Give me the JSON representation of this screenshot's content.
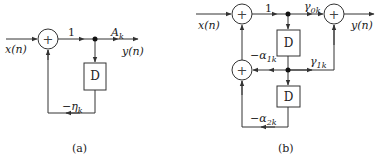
{
  "diagram_a": {
    "caption": "(a)",
    "input_label": "x(n)",
    "output_label": "y(n)",
    "forward_gain": "1",
    "output_gain": "A",
    "output_gain_sub": "k",
    "delay_label": "D",
    "feedback_gain": "−η",
    "feedback_gain_sub": "k",
    "adder_symbol": "+"
  },
  "diagram_b": {
    "caption": "(b)",
    "input_label": "x(n)",
    "output_label": "y(n)",
    "forward_gain": "1",
    "gain_0": "γ",
    "gain_0_sub": "0k",
    "gain_1": "γ",
    "gain_1_sub": "1k",
    "delay1_label": "D",
    "delay2_label": "D",
    "feedback_1": "−α",
    "feedback_1_sub": "1k",
    "feedback_2": "−α",
    "feedback_2_sub": "2k",
    "adder_symbol": "+"
  },
  "colors": {
    "line": "#333333",
    "background": "#ffffff"
  }
}
